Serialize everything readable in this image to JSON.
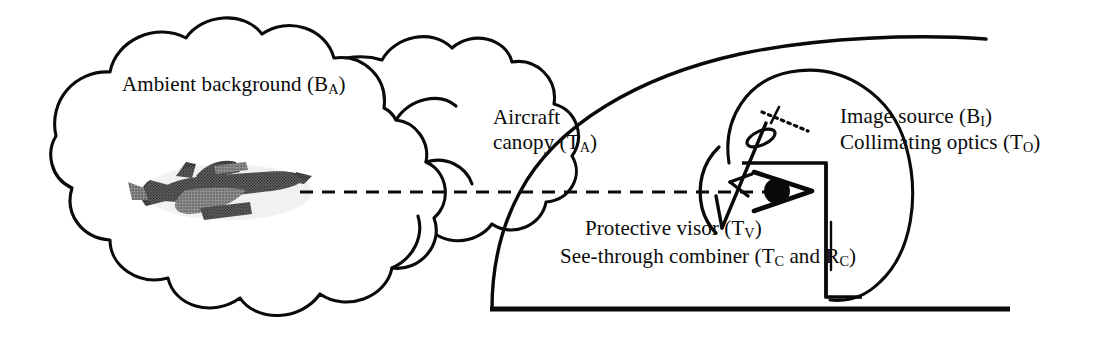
{
  "figure": {
    "kind": "technical-line-diagram",
    "background_color": "#ffffff",
    "ink_color": "#0a0a0a"
  },
  "labels": {
    "ambient_background": {
      "text": "Ambient background (B",
      "sub": "A",
      "tail": ")"
    },
    "aircraft_canopy_line1": "Aircraft",
    "aircraft_canopy_line2": {
      "text": "canopy   (T",
      "sub": "A",
      "tail": ")"
    },
    "image_source": {
      "text": "Image source (B",
      "sub": "I",
      "tail": ")"
    },
    "collimating_optics": {
      "text": "Collimating optics (T",
      "sub": "O",
      "tail": ")"
    },
    "protective_visor": {
      "text": "Protective visor (T",
      "sub": "V",
      "tail": ")"
    },
    "see_through_combiner": {
      "text": "See-through combiner (T",
      "sub": "C",
      "mid": " and R",
      "sub2": "C",
      "tail": ")"
    }
  },
  "symbols": {
    "cloud": "cloud-outline",
    "aircraft": "jet-aircraft-silhouette",
    "sight_line": "dashed-line-of-sight",
    "canopy": "canopy-curve",
    "cockpit_floor": "baseline",
    "helmet": "helmet-head-arc",
    "display_housing": "rectangular-box",
    "visor": "visor-arc",
    "combiner": "combiner-diagonal",
    "lens": "collimating-lens-ellipse",
    "image_source_element": "dotted-source-line",
    "eye": "eye-pupil-and-cone"
  },
  "geometry": {
    "width": 1112,
    "height": 338,
    "sight_line_y": 192,
    "baseline_y": 309,
    "baseline_x0": 490,
    "baseline_x1": 1010
  }
}
